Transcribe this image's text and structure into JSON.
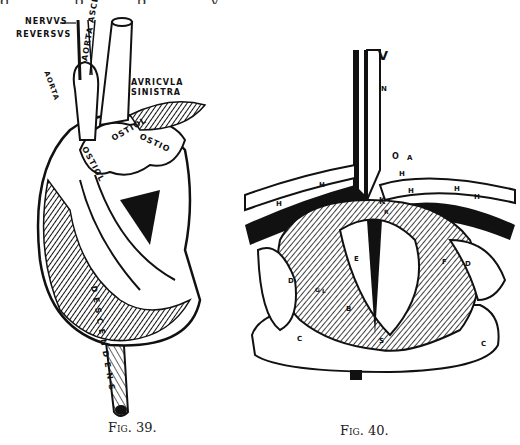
{
  "page": {
    "top_text_fragment": "g  .  .  .  .  .  p  ,  .  .  .  p  ,  .  .  .  .  y"
  },
  "figures": [
    {
      "id": "fig39",
      "caption": "Fig. 39.",
      "labels": {
        "nervus": "NERVVS",
        "reversus": "REVERSVS",
        "aorta_ascendens": "AORTA ASCEDES",
        "auricula_sinistra_1": "AVRICVLA",
        "auricula_sinistra_2": "SINISTRA",
        "aorta_left": "AORTA",
        "ostiolum_top": "OSTIOL",
        "ostiolum_mid": "OSTIOL",
        "ostiolum_left": "OSTIOL",
        "ostiolum_right": "OSTIO",
        "descendens": "DESCENDENS"
      }
    },
    {
      "id": "fig40",
      "caption": "Fig. 40.",
      "labels": {
        "V": "V",
        "N": "N",
        "O": "O",
        "A": "A",
        "H1": "H",
        "H2": "H",
        "H3": "H",
        "H4": "H",
        "H5": "H",
        "H6": "H",
        "K": "K",
        "R": "R",
        "E": "E",
        "F": "F",
        "D_left": "D",
        "D_right": "D",
        "G": "G",
        "L": "L",
        "B": "B",
        "C_left": "C",
        "C_right": "C",
        "S": "S"
      }
    }
  ]
}
